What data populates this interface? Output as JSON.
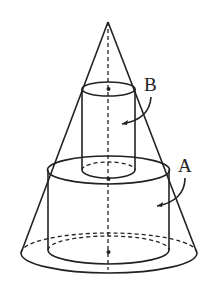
{
  "figure": {
    "labels": {
      "a": "A",
      "b": "B"
    },
    "parts": [
      {
        "name": "cone",
        "role": "outer solid"
      },
      {
        "name": "cylinder-a",
        "label": "A",
        "role": "lower, wider cylinder inscribed in cone"
      },
      {
        "name": "cylinder-b",
        "label": "B",
        "role": "upper, narrower cylinder inscribed in cone, resting on A"
      }
    ],
    "colors": {
      "stroke": "#222222",
      "background": "#ffffff"
    }
  }
}
